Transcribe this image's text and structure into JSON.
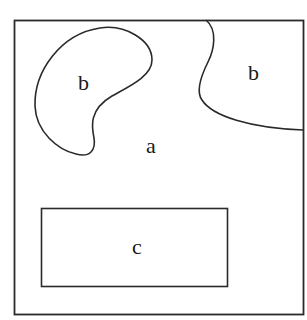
{
  "diagram": {
    "regions": [
      {
        "id": "outer",
        "label": "a"
      },
      {
        "id": "blob-left",
        "label": "b"
      },
      {
        "id": "blob-right",
        "label": "b"
      },
      {
        "id": "rect",
        "label": "c"
      }
    ],
    "colors": {
      "stroke": "#2a2a2a",
      "background": "#ffffff"
    }
  }
}
